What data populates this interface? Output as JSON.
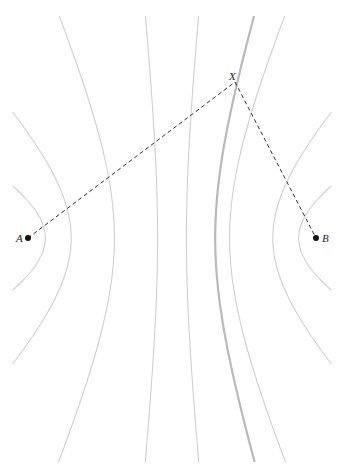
{
  "diagram": {
    "foci": [
      {
        "id": "A",
        "label": "A"
      },
      {
        "id": "B",
        "label": "B"
      }
    ],
    "point": {
      "id": "X",
      "label": "X"
    },
    "segments": [
      {
        "from": "A",
        "to": "X",
        "style": "dashed"
      },
      {
        "from": "X",
        "to": "B",
        "style": "dashed"
      }
    ],
    "hyperbola_family": {
      "focal_half_distance": 1.0,
      "vertex_ratios": [
        -0.88,
        -0.7,
        -0.4,
        -0.1,
        0.1,
        0.4,
        0.7,
        0.88
      ],
      "highlighted_ratio": 0.3,
      "highlight_note": "branch through X, |AX| - |BX| constant"
    },
    "colors": {
      "curve": "#cfcfcf",
      "highlight": "#b9b9b9",
      "segment": "#333333",
      "point": "#111111"
    }
  }
}
